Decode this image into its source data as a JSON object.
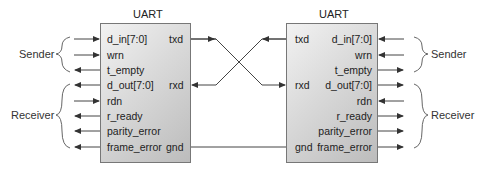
{
  "left_uart": {
    "title": "UART",
    "inputs_left": [
      "d_in[7:0]",
      "wrn",
      "t_empty",
      "d_out[7:0]",
      "rdn",
      "r_ready",
      "parity_error",
      "frame_error"
    ],
    "pins_right": [
      "txd",
      "rxd",
      "gnd"
    ]
  },
  "right_uart": {
    "title": "UART",
    "pins_left": [
      "txd",
      "rxd",
      "gnd"
    ],
    "ports_right": [
      "d_in[7:0]",
      "wrn",
      "t_empty",
      "d_out[7:0]",
      "rdn",
      "r_ready",
      "parity_error",
      "frame_error"
    ]
  },
  "groups": {
    "left_sender": "Sender",
    "left_receiver": "Receiver",
    "right_sender": "Sender",
    "right_receiver": "Receiver"
  },
  "signal_directions": {
    "d_in[7:0]": "in",
    "wrn": "in",
    "t_empty": "out",
    "d_out[7:0]": "out",
    "rdn": "in",
    "r_ready": "out",
    "parity_error": "out",
    "frame_error": "out"
  },
  "connections": [
    {
      "from": "left.txd",
      "to": "right.rxd"
    },
    {
      "from": "right.txd",
      "to": "left.rxd"
    },
    {
      "from": "left.gnd",
      "to": "right.gnd"
    }
  ],
  "colors": {
    "box_border": "#777777",
    "box_fill_light": "#f2f2f2",
    "box_fill_dark": "#bcbcbc",
    "wire": "#444444"
  }
}
